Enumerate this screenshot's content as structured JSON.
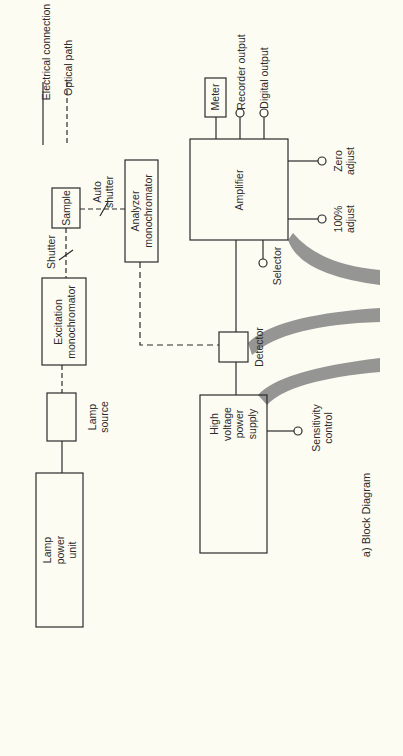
{
  "figure": {
    "caption": "a)  Block Diagram",
    "orientation": "rotated 90° counterclockwise"
  },
  "legend": {
    "electrical": "Electrical connection",
    "optical": "Optical path"
  },
  "blocks": {
    "lamp_power_unit": [
      "Lamp",
      "power",
      "unit"
    ],
    "lamp_source": [
      "Lamp",
      "source"
    ],
    "excitation_monochromator": [
      "Excitation",
      "monochromator"
    ],
    "sample": "Sample",
    "analyzer_monochromator": [
      "Analyzer",
      "monochromator"
    ],
    "detector": "Detector",
    "amplifier": "Amplifier",
    "meter": "Meter",
    "high_voltage_power_supply": [
      "High",
      "voltage",
      "power",
      "supply"
    ]
  },
  "labels": {
    "shutter": "Shutter",
    "auto_shutter": [
      "Auto",
      "shutter"
    ],
    "recorder_output": "Recorder output",
    "digital_output": "Digital output",
    "zero_adjust": [
      "Zero",
      "adjust"
    ],
    "hundred_adjust": [
      "100%",
      "adjust"
    ],
    "selector": "Selector",
    "sensitivity_control": [
      "Sensitivity",
      "control"
    ]
  },
  "colors": {
    "background": "#fdfcf3",
    "line": "#2a2a2a",
    "band": "#8a8a8a"
  }
}
